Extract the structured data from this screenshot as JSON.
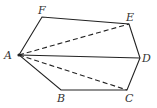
{
  "diagram": {
    "type": "hexagon-with-diagonals",
    "vertices": [
      {
        "name": "A",
        "x": 19,
        "y": 55
      },
      {
        "name": "F",
        "x": 42,
        "y": 17
      },
      {
        "name": "E",
        "x": 129,
        "y": 24
      },
      {
        "name": "D",
        "x": 140,
        "y": 58
      },
      {
        "name": "C",
        "x": 127,
        "y": 90
      },
      {
        "name": "B",
        "x": 61,
        "y": 90
      }
    ],
    "edges_solid": [
      "AF",
      "FE",
      "ED",
      "DC",
      "CB",
      "BA",
      "AD"
    ],
    "edges_dashed": [
      "AE",
      "AC"
    ],
    "labels": {
      "A": "A",
      "B": "B",
      "C": "C",
      "D": "D",
      "E": "E",
      "F": "F"
    },
    "colors": {
      "stroke": "#222222",
      "label": "#333333",
      "background": "#ffffff"
    }
  }
}
